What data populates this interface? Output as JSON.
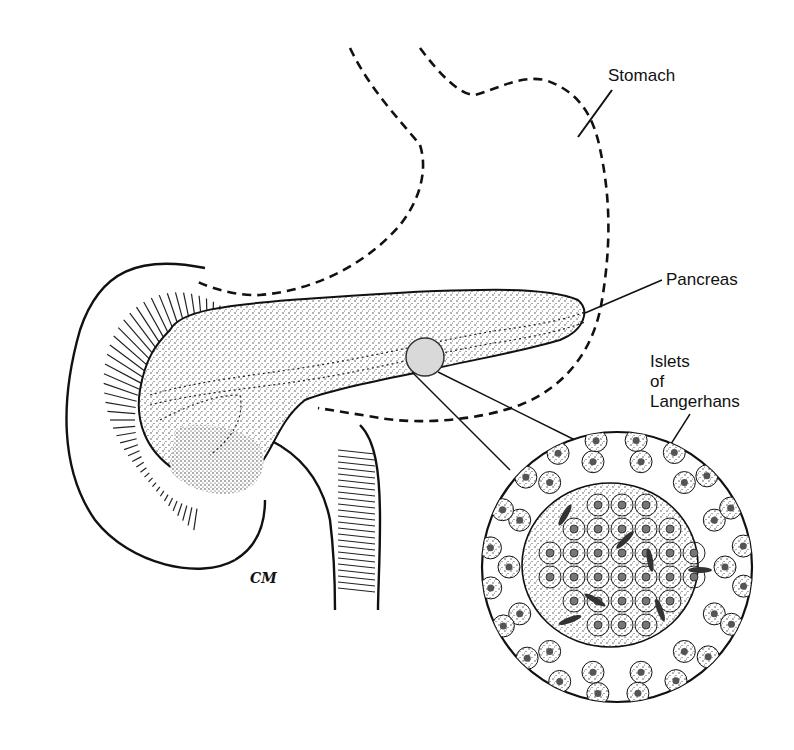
{
  "figure": {
    "labels": {
      "stomach": "Stomach",
      "pancreas": "Pancreas",
      "islets_line1": "Islets",
      "islets_line2": "of",
      "islets_line3": "Langerhans"
    },
    "signature": "CM",
    "colors": {
      "ink": "#111111",
      "islet_highlight": "#d9d9d9",
      "background": "#ffffff"
    }
  }
}
